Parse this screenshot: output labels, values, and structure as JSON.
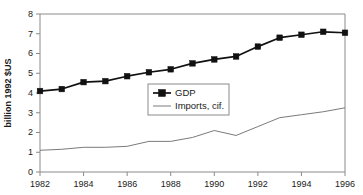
{
  "chart_data": {
    "type": "line",
    "title": "",
    "xlabel": "",
    "ylabel": "billion 1992 $US",
    "xlim": [
      1982,
      1996
    ],
    "ylim": [
      0,
      8
    ],
    "ytick_step": 1,
    "xtick_step": 2,
    "grid": false,
    "legend_position": "center",
    "x": [
      1982,
      1983,
      1984,
      1985,
      1986,
      1987,
      1988,
      1989,
      1990,
      1991,
      1992,
      1993,
      1994,
      1995,
      1996
    ],
    "xtick_labels": [
      "1982",
      "1984",
      "1986",
      "1988",
      "1990",
      "1992",
      "1994",
      "1996"
    ],
    "ytick_labels": [
      "0",
      "1",
      "2",
      "3",
      "4",
      "5",
      "6",
      "7",
      "8"
    ],
    "series": [
      {
        "name": "GDP",
        "marker": "square",
        "color": "#111111",
        "values": [
          4.1,
          4.2,
          4.55,
          4.6,
          4.85,
          5.05,
          5.2,
          5.5,
          5.7,
          5.85,
          6.35,
          6.8,
          6.95,
          7.1,
          7.05
        ]
      },
      {
        "name": "Imports, cif.",
        "marker": "none",
        "color": "#6b6b6b",
        "values": [
          1.1,
          1.15,
          1.25,
          1.25,
          1.3,
          1.55,
          1.55,
          1.75,
          2.1,
          1.85,
          2.3,
          2.75,
          2.9,
          3.05,
          3.25
        ]
      }
    ]
  },
  "legend": {
    "items": [
      {
        "label": "GDP"
      },
      {
        "label": "Imports, cif."
      }
    ]
  },
  "colors": {
    "axis": "#8a8a8a",
    "gdp": "#111111",
    "imports": "#6b6b6b",
    "background": "#ffffff"
  }
}
